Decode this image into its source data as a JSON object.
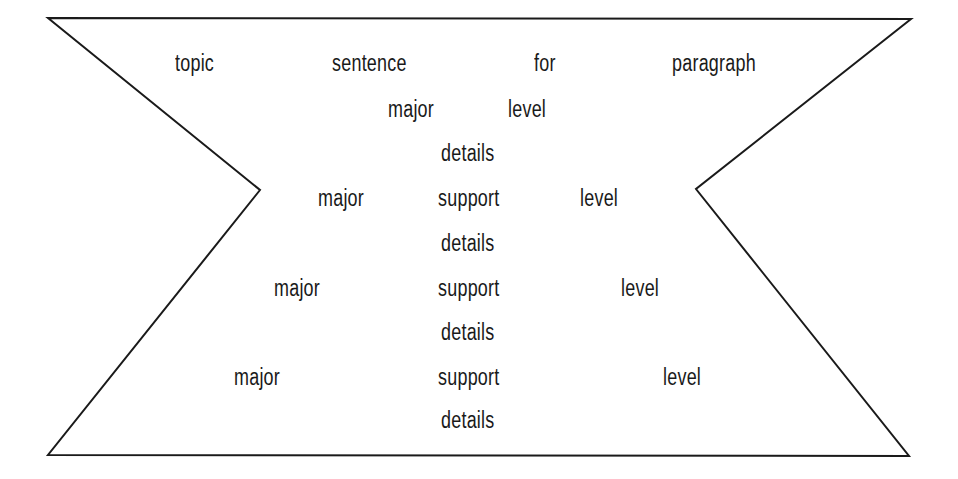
{
  "diagram": {
    "shape": {
      "type": "hourglass-outline",
      "stroke_color": "#1a1a1a",
      "vertices": {
        "top_left": [
          48,
          18
        ],
        "top_right": [
          911,
          19
        ],
        "right_notch": [
          696,
          189
        ],
        "bottom_right": [
          909,
          456
        ],
        "bottom_left": [
          48,
          455
        ],
        "left_notch": [
          260,
          190
        ]
      }
    },
    "rows": [
      {
        "name": "topic-sentence-row",
        "words": [
          {
            "text": "topic",
            "x": 175,
            "y": 52
          },
          {
            "text": "sentence",
            "x": 332,
            "y": 52
          },
          {
            "text": "for",
            "x": 534,
            "y": 52
          },
          {
            "text": "paragraph",
            "x": 672,
            "y": 52
          }
        ]
      },
      {
        "name": "major-level-row",
        "words": [
          {
            "text": "major",
            "x": 388,
            "y": 98
          },
          {
            "text": "level",
            "x": 508,
            "y": 98
          }
        ]
      },
      {
        "name": "details-row-1",
        "words": [
          {
            "text": "details",
            "x": 441,
            "y": 142
          }
        ]
      },
      {
        "name": "major-support-level-row-1",
        "words": [
          {
            "text": "major",
            "x": 318,
            "y": 187
          },
          {
            "text": "support",
            "x": 438,
            "y": 187
          },
          {
            "text": "level",
            "x": 580,
            "y": 187
          }
        ]
      },
      {
        "name": "details-row-2",
        "words": [
          {
            "text": "details",
            "x": 441,
            "y": 232
          }
        ]
      },
      {
        "name": "major-support-level-row-2",
        "words": [
          {
            "text": "major",
            "x": 274,
            "y": 277
          },
          {
            "text": "support",
            "x": 438,
            "y": 277
          },
          {
            "text": "level",
            "x": 621,
            "y": 277
          }
        ]
      },
      {
        "name": "details-row-3",
        "words": [
          {
            "text": "details",
            "x": 441,
            "y": 321
          }
        ]
      },
      {
        "name": "major-support-level-row-3",
        "words": [
          {
            "text": "major",
            "x": 234,
            "y": 366
          },
          {
            "text": "support",
            "x": 438,
            "y": 366
          },
          {
            "text": "level",
            "x": 663,
            "y": 366
          }
        ]
      },
      {
        "name": "details-row-4",
        "words": [
          {
            "text": "details",
            "x": 441,
            "y": 409
          }
        ]
      }
    ]
  }
}
